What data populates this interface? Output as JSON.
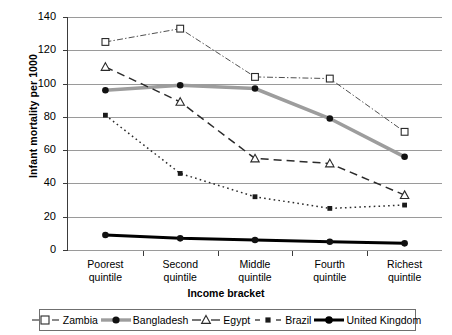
{
  "chart_data": {
    "type": "line",
    "title": "",
    "xlabel": "Income bracket",
    "ylabel": "Infant mortality per 1000",
    "categories": [
      "Poorest quintile",
      "Second quintile",
      "Middle quintile",
      "Fourth quintile",
      "Richest quintile"
    ],
    "ylim": [
      0,
      140
    ],
    "yticks": [
      0,
      20,
      40,
      60,
      80,
      100,
      120,
      140
    ],
    "grid": true,
    "legend_position": "bottom",
    "series": [
      {
        "name": "Zambia",
        "values": [
          125,
          133,
          104,
          103,
          71
        ],
        "marker": "open-square",
        "line": "dash-dot",
        "color": "#3b3b3b"
      },
      {
        "name": "Bangladesh",
        "values": [
          96,
          99,
          97,
          79,
          56
        ],
        "marker": "filled-circle",
        "line": "solid-thick-gray",
        "color": "#9d9d9d"
      },
      {
        "name": "Egypt",
        "values": [
          110,
          89,
          55,
          52,
          33
        ],
        "marker": "open-triangle",
        "line": "dashed",
        "color": "#2b2b2b"
      },
      {
        "name": "Brazil",
        "values": [
          81,
          46,
          32,
          25,
          27
        ],
        "marker": "filled-square",
        "line": "dotted",
        "color": "#2b2b2b"
      },
      {
        "name": "United Kingdom",
        "values": [
          9,
          7,
          6,
          5,
          4
        ],
        "marker": "filled-circle",
        "line": "solid-thick-black",
        "color": "#000000"
      }
    ]
  },
  "legend": {
    "items": [
      {
        "label": "Zambia"
      },
      {
        "label": "Bangladesh"
      },
      {
        "label": "Egypt"
      },
      {
        "label": "Brazil"
      },
      {
        "label": "United Kingdom"
      }
    ]
  },
  "colors": {
    "grid": "#9a9a9a",
    "axis": "#3b3b3b",
    "bangladesh": "#9d9d9d",
    "uk": "#000000",
    "ink": "#2b2b2b"
  }
}
